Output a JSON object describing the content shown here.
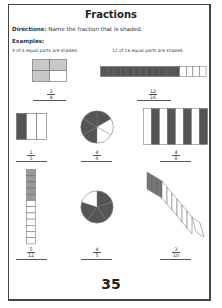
{
  "page": {
    "title": "Fractions",
    "directions_label": "Directions:",
    "directions_text": " Name the fraction that is shaded.",
    "examples_label": "Examples:",
    "page_number": "35"
  },
  "colors": {
    "shade_light": "#c8c8c8",
    "shade_dark": "#555555",
    "outline": "#666666"
  },
  "examples": [
    {
      "caption": "3 of 4 equal parts are shaded.",
      "shape": "grid-2x2",
      "shaded": 3,
      "parts": 4,
      "numerator": "3",
      "denominator": "4"
    },
    {
      "caption": "12 of 16 equal parts are shaded.",
      "shape": "horizontal-strip",
      "shaded": 12,
      "parts": 16,
      "numerator": "12",
      "denominator": "16"
    }
  ],
  "problems": [
    {
      "shape": "vertical-bars",
      "shaded": 1,
      "parts": 3,
      "numerator": "1",
      "denominator": "3"
    },
    {
      "shape": "circle",
      "shaded": 4,
      "parts": 6,
      "numerator": "4",
      "denominator": "6"
    },
    {
      "shape": "vertical-bars-alternating",
      "shaded": 4,
      "parts": 8,
      "numerator": "4",
      "denominator": "8"
    },
    {
      "shape": "vertical-strip",
      "shaded": 5,
      "parts": 12,
      "numerator": "5",
      "denominator": "12"
    },
    {
      "shape": "circle",
      "shaded": 4,
      "parts": 5,
      "numerator": "4",
      "denominator": "5"
    },
    {
      "shape": "diagonal-strip",
      "shaded": 3,
      "parts": 10,
      "numerator": "3",
      "denominator": "10"
    }
  ]
}
